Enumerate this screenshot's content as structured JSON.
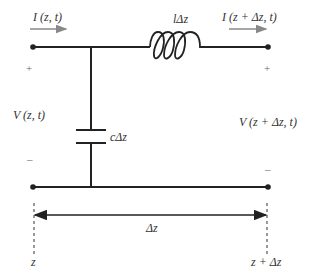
{
  "diagram": {
    "colors": {
      "wire": "#222222",
      "current_arrow": "#888888",
      "text": "#333333",
      "sign": "#666666"
    },
    "labels": {
      "current_in": "I (z, t)",
      "current_out": "I (z + Δz, t)",
      "inductor": "lΔz",
      "capacitor": "cΔz",
      "voltage_in": "V (z, t)",
      "voltage_out": "V (z + Δz, t)",
      "plus_left": "+",
      "minus_left": "–",
      "plus_right": "+",
      "minus_right": "–",
      "segment_length": "Δz",
      "position_left": "z",
      "position_right": "z + Δz"
    },
    "components": [
      {
        "type": "inductor",
        "label": "lΔz",
        "location": "series, top conductor"
      },
      {
        "type": "capacitor",
        "label": "cΔz",
        "location": "shunt, between conductors"
      }
    ],
    "nodes": [
      "top-left terminal",
      "bottom-left terminal",
      "top-right terminal",
      "bottom-right terminal"
    ]
  }
}
